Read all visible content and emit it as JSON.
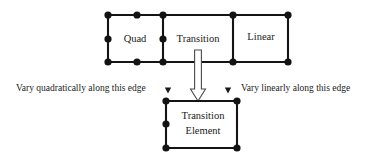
{
  "diagram": {
    "colors": {
      "mesh_line": "#141414",
      "node": "#131313",
      "text": "#1a1a1a",
      "hollow_arrow_fill": "#ffffff",
      "hollow_arrow_stroke": "#4a4a4a",
      "background": "#ffffff"
    },
    "top_row": {
      "elements": [
        {
          "id": "quad",
          "label": "Quad",
          "label_x": 135,
          "label_y": 39,
          "x": 108,
          "y": 15,
          "width": 55,
          "height": 47,
          "node_count": 8,
          "order": "quadratic"
        },
        {
          "id": "transition",
          "label": "Transition",
          "label_x": 198,
          "label_y": 39,
          "x": 163,
          "y": 15,
          "width": 70,
          "height": 47,
          "node_count": 6,
          "order": "transition"
        },
        {
          "id": "linear",
          "label": "Linear",
          "label_x": 260,
          "label_y": 37,
          "x": 233,
          "y": 15,
          "width": 55,
          "height": 47,
          "node_count": 4,
          "order": "linear"
        }
      ],
      "nodes": [
        {
          "x": 108,
          "y": 15
        },
        {
          "x": 137,
          "y": 15
        },
        {
          "x": 163,
          "y": 15
        },
        {
          "x": 233,
          "y": 15
        },
        {
          "x": 288,
          "y": 15
        },
        {
          "x": 108,
          "y": 39
        },
        {
          "x": 163,
          "y": 39
        },
        {
          "x": 108,
          "y": 62
        },
        {
          "x": 137,
          "y": 62
        },
        {
          "x": 163,
          "y": 62
        },
        {
          "x": 233,
          "y": 62
        },
        {
          "x": 288,
          "y": 62
        }
      ]
    },
    "bottom_element": {
      "id": "transition-element",
      "label_line1": "Transition",
      "label_line2": "Element",
      "label_x": 202,
      "label_y1": 117,
      "label_y2": 132,
      "x": 166,
      "y": 101,
      "width": 71,
      "height": 47,
      "node_count": 5,
      "nodes": [
        {
          "x": 166,
          "y": 101
        },
        {
          "x": 237,
          "y": 101
        },
        {
          "x": 166,
          "y": 124
        },
        {
          "x": 166,
          "y": 148
        },
        {
          "x": 237,
          "y": 148
        }
      ]
    },
    "hollow_arrow": {
      "name": "transition-flow-arrow",
      "direction": "down",
      "from_x": 198,
      "from_y": 50,
      "to_x": 198,
      "to_y": 101,
      "shaft_width": 7,
      "head_width": 15,
      "head_height": 12
    },
    "annotations": [
      {
        "id": "left-annotation",
        "text": "Vary quadratically along this edge",
        "text_x": 16,
        "text_y": 89,
        "arrow": {
          "name": "left-down-arrow",
          "x": 168,
          "y_top": 79,
          "y_bottom": 93,
          "direction": "down"
        }
      },
      {
        "id": "right-annotation",
        "text": "Vary linearly along this edge",
        "text_x": 241,
        "text_y": 89,
        "arrow": {
          "name": "right-down-arrow",
          "x": 228,
          "y_top": 79,
          "y_bottom": 93,
          "direction": "down"
        }
      }
    ]
  }
}
